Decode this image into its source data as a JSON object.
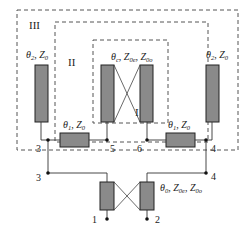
{
  "diagram": {
    "regions": [
      {
        "id": "III",
        "label": "III"
      },
      {
        "id": "II",
        "label": "II"
      },
      {
        "id": "I",
        "label": "I"
      }
    ],
    "elements": {
      "left_stub": {
        "theta": "θ",
        "theta_sub": "2",
        "z": "Z",
        "z_sub": "0"
      },
      "right_stub": {
        "theta": "θ",
        "theta_sub": "2",
        "z": "Z",
        "z_sub": "0"
      },
      "coupled_inner": {
        "theta": "θ",
        "theta_sub": "c",
        "z1": "Z",
        "z1_sub": "0e",
        "z2": "Z",
        "z2_sub": "0o"
      },
      "left_series": {
        "theta": "θ",
        "theta_sub": "1",
        "z": "Z",
        "z_sub": "0"
      },
      "right_series": {
        "theta": "θ",
        "theta_sub": "1",
        "z": "Z",
        "z_sub": "0"
      },
      "coupled_bottom": {
        "theta": "θ",
        "theta_sub": "0",
        "z1": "Z",
        "z1_sub": "0e",
        "z2": "Z",
        "z2_sub": "0o"
      }
    },
    "ports": {
      "p3_upper": "3",
      "p5": "5",
      "p6": "6",
      "p4_upper": "4",
      "p3_lower": "3",
      "p4_lower": "4",
      "p1": "1",
      "p2": "2"
    },
    "colors": {
      "line_fill": "#8a8a8a",
      "stroke": "#222222",
      "dashed": "#555555",
      "wire": "#333333"
    }
  }
}
